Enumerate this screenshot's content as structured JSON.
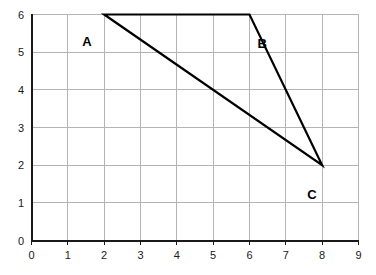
{
  "chart_data": {
    "type": "line",
    "title": "",
    "xlabel": "",
    "ylabel": "",
    "xlim": [
      0,
      9
    ],
    "ylim": [
      0,
      6
    ],
    "grid": true,
    "legend": "none",
    "x_ticks": [
      "0",
      "1",
      "2",
      "3",
      "4",
      "5",
      "6",
      "7",
      "8",
      "9"
    ],
    "y_ticks": [
      "0",
      "1",
      "2",
      "3",
      "4",
      "5",
      "6"
    ],
    "series": [
      {
        "name": "triangle-ABC",
        "closed": true,
        "points": [
          {
            "label": "A",
            "x": 2,
            "y": 6
          },
          {
            "label": "B",
            "x": 6,
            "y": 6
          },
          {
            "label": "C",
            "x": 8,
            "y": 2
          }
        ]
      }
    ],
    "annotations": [
      {
        "text": "A",
        "x": 2,
        "y": 6,
        "dx": -22,
        "dy": 20
      },
      {
        "text": "B",
        "x": 6,
        "y": 6,
        "dx": 8,
        "dy": 22
      },
      {
        "text": "C",
        "x": 8,
        "y": 2,
        "dx": -15,
        "dy": 23
      }
    ],
    "colors": {
      "background": "#ffffff",
      "grid": "#b4b4b4",
      "axis": "#1a1a1a",
      "line": "#000000",
      "tick_text": "#1a1a1a",
      "label_text": "#000000"
    }
  }
}
